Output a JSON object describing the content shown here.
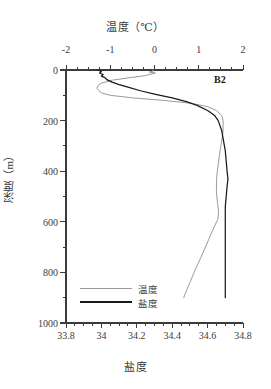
{
  "chart_data": {
    "type": "line",
    "title": "温度（℃）",
    "subtitle": "",
    "station_label": "B2",
    "orientation": "vertical-profile",
    "grid": false,
    "legend_position": "bottom-left",
    "axes": {
      "top": {
        "label": "温度（℃）",
        "name": "temperature",
        "unit": "℃",
        "range": [
          -2,
          2
        ],
        "ticks": [
          -2,
          -1,
          0,
          1,
          2
        ],
        "tick_labels": [
          "-2",
          "-1",
          "0",
          "1",
          "2"
        ],
        "minor_tick_step": 0.25
      },
      "bottom": {
        "label": "盐度",
        "name": "salinity",
        "unit": "",
        "range": [
          33.8,
          34.8
        ],
        "ticks": [
          33.8,
          34.0,
          34.2,
          34.4,
          34.6,
          34.8
        ],
        "tick_labels": [
          "33.8",
          "34",
          "34.2",
          "34.4",
          "34.6",
          "34.8"
        ],
        "minor_tick_step": 0.05
      },
      "left": {
        "label": "深度（m）",
        "name": "depth",
        "unit": "m",
        "range": [
          0,
          1000
        ],
        "inverted": true,
        "ticks": [
          0,
          200,
          400,
          600,
          800,
          1000
        ],
        "tick_labels": [
          "0",
          "200",
          "400",
          "600",
          "800",
          "1000"
        ],
        "minor_ticks": [
          100,
          300,
          500,
          700,
          900
        ]
      }
    },
    "legend": [
      {
        "name": "温度",
        "color": "#9a9a9a",
        "series": "temperature"
      },
      {
        "name": "盐度",
        "color": "#1a1a1a",
        "series": "salinity"
      }
    ],
    "series": [
      {
        "name": "温度",
        "key": "temperature",
        "color": "#9a9a9a",
        "x_axis": "top",
        "x_unit": "℃",
        "points": [
          {
            "depth": 0,
            "value": -0.05
          },
          {
            "depth": 4,
            "value": -0.02
          },
          {
            "depth": 8,
            "value": -0.12
          },
          {
            "depth": 12,
            "value": 0.02
          },
          {
            "depth": 16,
            "value": -0.08
          },
          {
            "depth": 22,
            "value": -0.2
          },
          {
            "depth": 30,
            "value": -0.55
          },
          {
            "depth": 40,
            "value": -0.95
          },
          {
            "depth": 52,
            "value": -1.2
          },
          {
            "depth": 62,
            "value": -1.28
          },
          {
            "depth": 72,
            "value": -1.3
          },
          {
            "depth": 82,
            "value": -1.26
          },
          {
            "depth": 92,
            "value": -1.18
          },
          {
            "depth": 100,
            "value": -1.0
          },
          {
            "depth": 110,
            "value": -0.5
          },
          {
            "depth": 120,
            "value": 0.2
          },
          {
            "depth": 132,
            "value": 0.85
          },
          {
            "depth": 145,
            "value": 1.2
          },
          {
            "depth": 160,
            "value": 1.4
          },
          {
            "depth": 180,
            "value": 1.52
          },
          {
            "depth": 200,
            "value": 1.55
          },
          {
            "depth": 240,
            "value": 1.55
          },
          {
            "depth": 280,
            "value": 1.52
          },
          {
            "depth": 320,
            "value": 1.48
          },
          {
            "depth": 360,
            "value": 1.45
          },
          {
            "depth": 400,
            "value": 1.42
          },
          {
            "depth": 440,
            "value": 1.4
          },
          {
            "depth": 480,
            "value": 1.4
          },
          {
            "depth": 520,
            "value": 1.42
          },
          {
            "depth": 560,
            "value": 1.45
          },
          {
            "depth": 590,
            "value": 1.43
          },
          {
            "depth": 620,
            "value": 1.35
          },
          {
            "depth": 660,
            "value": 1.25
          },
          {
            "depth": 700,
            "value": 1.15
          },
          {
            "depth": 740,
            "value": 1.05
          },
          {
            "depth": 790,
            "value": 0.92
          },
          {
            "depth": 840,
            "value": 0.8
          },
          {
            "depth": 890,
            "value": 0.68
          },
          {
            "depth": 900,
            "value": 0.66
          }
        ]
      },
      {
        "name": "盐度",
        "key": "salinity",
        "color": "#1a1a1a",
        "x_axis": "bottom",
        "x_unit": "",
        "points": [
          {
            "depth": 0,
            "value": 33.98
          },
          {
            "depth": 6,
            "value": 34.0
          },
          {
            "depth": 12,
            "value": 33.99
          },
          {
            "depth": 18,
            "value": 34.01
          },
          {
            "depth": 24,
            "value": 34.0
          },
          {
            "depth": 30,
            "value": 34.02
          },
          {
            "depth": 38,
            "value": 34.03
          },
          {
            "depth": 48,
            "value": 34.06
          },
          {
            "depth": 58,
            "value": 34.1
          },
          {
            "depth": 70,
            "value": 34.16
          },
          {
            "depth": 82,
            "value": 34.22
          },
          {
            "depth": 95,
            "value": 34.3
          },
          {
            "depth": 110,
            "value": 34.4
          },
          {
            "depth": 125,
            "value": 34.48
          },
          {
            "depth": 140,
            "value": 34.54
          },
          {
            "depth": 160,
            "value": 34.6
          },
          {
            "depth": 180,
            "value": 34.64
          },
          {
            "depth": 200,
            "value": 34.66
          },
          {
            "depth": 240,
            "value": 34.68
          },
          {
            "depth": 280,
            "value": 34.69
          },
          {
            "depth": 320,
            "value": 34.7
          },
          {
            "depth": 360,
            "value": 34.705
          },
          {
            "depth": 400,
            "value": 34.71
          },
          {
            "depth": 430,
            "value": 34.715
          },
          {
            "depth": 460,
            "value": 34.71
          },
          {
            "depth": 500,
            "value": 34.705
          },
          {
            "depth": 540,
            "value": 34.7
          },
          {
            "depth": 580,
            "value": 34.7
          },
          {
            "depth": 620,
            "value": 34.7
          },
          {
            "depth": 660,
            "value": 34.7
          },
          {
            "depth": 700,
            "value": 34.7
          },
          {
            "depth": 760,
            "value": 34.7
          },
          {
            "depth": 820,
            "value": 34.7
          },
          {
            "depth": 880,
            "value": 34.7
          },
          {
            "depth": 900,
            "value": 34.7
          }
        ]
      }
    ]
  }
}
